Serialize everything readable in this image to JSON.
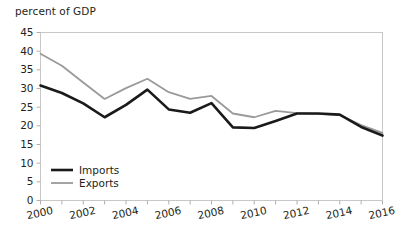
{
  "chart_data": {
    "type": "line",
    "title": "percent of GDP",
    "xlabel": "",
    "ylabel": "percent of GDP",
    "x": [
      2000,
      2001,
      2002,
      2003,
      2004,
      2005,
      2006,
      2007,
      2008,
      2009,
      2010,
      2011,
      2012,
      2013,
      2014,
      2015,
      2016
    ],
    "xlim": [
      2000,
      2016
    ],
    "ylim": [
      0,
      45
    ],
    "ytick_labels": [
      "0",
      "5",
      "10",
      "15",
      "20",
      "25",
      "30",
      "35",
      "40",
      "45"
    ],
    "yticks": [
      0,
      5,
      10,
      15,
      20,
      25,
      30,
      35,
      40,
      45
    ],
    "xtick_labels": [
      "2000",
      "2002",
      "2004",
      "2006",
      "2008",
      "2010",
      "2012",
      "2014",
      "2016"
    ],
    "xticks": [
      2000,
      2002,
      2004,
      2006,
      2008,
      2010,
      2012,
      2014,
      2016
    ],
    "grid": false,
    "legend_position": "inside lower-left",
    "series": [
      {
        "name": "Imports",
        "color": "#1a1a1a",
        "line_width": 2.6,
        "values": [
          30.8,
          28.8,
          26.0,
          22.3,
          25.6,
          29.7,
          24.4,
          23.5,
          26.1,
          19.6,
          19.4,
          21.3,
          23.3,
          23.3,
          23.0,
          19.7,
          17.4
        ]
      },
      {
        "name": "Exports",
        "color": "#9a9a9a",
        "line_width": 1.8,
        "values": [
          39.3,
          36.1,
          31.6,
          27.2,
          30.1,
          32.6,
          29.0,
          27.2,
          28.0,
          23.3,
          22.3,
          24.0,
          23.4,
          23.2,
          22.9,
          20.2,
          18.1
        ]
      }
    ]
  },
  "legend": {
    "items": [
      {
        "label": "Imports",
        "color": "#1a1a1a"
      },
      {
        "label": "Exports",
        "color": "#9a9a9a"
      }
    ]
  },
  "style": {
    "frame_color": "#c8c8c8",
    "tick_color": "#b0b0b0",
    "text_color": "#231f20",
    "background": "#ffffff"
  }
}
